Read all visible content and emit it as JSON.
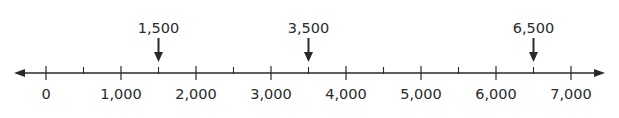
{
  "chart_data": {
    "type": "number_line",
    "range": [
      0,
      7000
    ],
    "major_ticks": [
      0,
      1000,
      2000,
      3000,
      4000,
      5000,
      6000,
      7000
    ],
    "minor_ticks": [
      500,
      1500,
      2500,
      3500,
      4500,
      5500,
      6500
    ],
    "tick_labels": [
      "0",
      "1,000",
      "2,000",
      "3,000",
      "4,000",
      "5,000",
      "6,000",
      "7,000"
    ],
    "marked_points": [
      {
        "value": 1500,
        "label": "1,500"
      },
      {
        "value": 3500,
        "label": "3,500"
      },
      {
        "value": 6500,
        "label": "6,500"
      }
    ],
    "arrows_both_ends": true
  },
  "colors": {
    "line": "#2a2a2a",
    "text": "#2a2a2a"
  }
}
